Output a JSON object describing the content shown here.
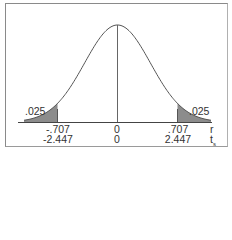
{
  "chart_data": {
    "type": "area",
    "title": "",
    "distribution": "t",
    "tail_areas": [
      {
        "side": "left",
        "area": ".025",
        "cutoff_r": "-.707",
        "cutoff_t": "-2.447"
      },
      {
        "side": "right",
        "area": ".025",
        "cutoff_r": ".707",
        "cutoff_t": "2.447"
      }
    ],
    "x_axes": [
      {
        "name": "r",
        "ticks": [
          "-.707",
          "0",
          ".707"
        ]
      },
      {
        "name": "ts",
        "ticks": [
          "-2.447",
          "0",
          "2.447"
        ]
      }
    ],
    "center": "0",
    "shade_color": "#8c8c8c",
    "line_color": "#555555"
  },
  "labels": {
    "left_area": ".025",
    "right_area": ".025",
    "r_left": "-.707",
    "r_center": "0",
    "r_right": ".707",
    "r_axis": "r",
    "t_left": "-2.447",
    "t_center": "0",
    "t_right": "2.447",
    "t_axis": "t",
    "t_sub": "s"
  }
}
